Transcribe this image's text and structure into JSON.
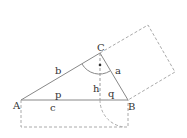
{
  "diagram": {
    "labels": {
      "A": "A",
      "B": "B",
      "C": "C",
      "a": "a",
      "b": "b",
      "c": "c",
      "h": "h",
      "p": "p",
      "q": "q"
    },
    "colors": {
      "line": "#777777",
      "dashed": "#aaaaaa",
      "text": "#333333"
    }
  }
}
